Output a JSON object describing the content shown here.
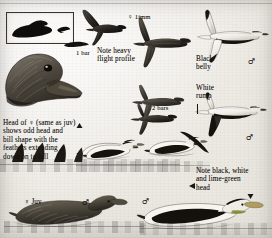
{
  "plate": {
    "title": "Common Eider identification plate",
    "width": 272,
    "height": 238,
    "paper_color": "#f2f0ec",
    "ink_color": "#181511"
  },
  "annotations": [
    {
      "id": "one-bar",
      "text": "1 bar",
      "x": 76,
      "y": 49
    },
    {
      "id": "note-heavy",
      "text": "Note heavy\nflight profile",
      "x": 97,
      "y": 48
    },
    {
      "id": "female-1imm",
      "text": "♀ 1imm",
      "x": 128,
      "y": 14
    },
    {
      "id": "black-belly",
      "text": "Black\nbelly",
      "x": 196,
      "y": 56
    },
    {
      "id": "white-rump",
      "text": "White\nrump",
      "x": 196,
      "y": 85
    },
    {
      "id": "two-bars",
      "text": "2 bars",
      "x": 152,
      "y": 105
    },
    {
      "id": "head-of-female",
      "text": "Head of ♀ (same as juv)\nshows odd head and\nbill shape with the\nfeathers extending\ndown on to bill",
      "x": 3,
      "y": 120
    },
    {
      "id": "female-juv",
      "text": "♀ Juv",
      "x": 24,
      "y": 199
    },
    {
      "id": "note-black-white",
      "text": "Note black, white\nand lime-green\nhead",
      "x": 196,
      "y": 168
    }
  ],
  "sex_symbols": [
    {
      "id": "male-top-right",
      "symbol": "♂",
      "x": 248,
      "y": 60
    },
    {
      "id": "male-mid-right",
      "symbol": "♂",
      "x": 246,
      "y": 136
    },
    {
      "id": "male-bottom-left",
      "symbol": "♂",
      "x": 82,
      "y": 200
    },
    {
      "id": "male-bottom-mid",
      "symbol": "♂",
      "x": 142,
      "y": 199
    }
  ],
  "figures": [
    {
      "id": "silhouette-box",
      "label": "framed swimming eider silhouette",
      "x": 6,
      "y": 12,
      "w": 66,
      "h": 30
    },
    {
      "id": "head-portrait",
      "label": "female eider head portrait",
      "x": 2,
      "y": 44,
      "w": 78,
      "h": 72
    },
    {
      "id": "flight-dark-upper",
      "label": "dark eider in flight, upper left",
      "x": 78,
      "y": 10,
      "w": 48,
      "h": 34
    },
    {
      "id": "flight-female-imm",
      "label": "female immature in flight",
      "x": 128,
      "y": 10,
      "w": 60,
      "h": 52
    },
    {
      "id": "flight-male-upper",
      "label": "adult male in flight, black belly and white rump",
      "x": 190,
      "y": 12,
      "w": 76,
      "h": 56
    },
    {
      "id": "flight-pair-mid",
      "label": "two eiders in flight, mid plate",
      "x": 126,
      "y": 86,
      "w": 62,
      "h": 46
    },
    {
      "id": "flight-male-mid",
      "label": "adult male in flight, mid right",
      "x": 192,
      "y": 96,
      "w": 74,
      "h": 48
    },
    {
      "id": "swim-male-a",
      "label": "adult male swimming, centre",
      "x": 78,
      "y": 132,
      "w": 64,
      "h": 36
    },
    {
      "id": "swim-male-b",
      "label": "adult male swimming, right",
      "x": 146,
      "y": 130,
      "w": 62,
      "h": 36
    },
    {
      "id": "swim-female-juv",
      "label": "female juvenile swimming",
      "x": 12,
      "y": 190,
      "w": 112,
      "h": 44
    },
    {
      "id": "swim-male-large",
      "label": "adult male swimming, foreground",
      "x": 140,
      "y": 192,
      "w": 126,
      "h": 44
    }
  ],
  "water_bands": [
    {
      "id": "water-upper",
      "x": 0,
      "y": 160,
      "w": 176,
      "h": 14
    },
    {
      "id": "water-mid",
      "x": 78,
      "y": 162,
      "w": 130,
      "h": 10
    },
    {
      "id": "water-lower",
      "x": 6,
      "y": 222,
      "w": 136,
      "h": 12
    },
    {
      "id": "water-right",
      "x": 142,
      "y": 224,
      "w": 128,
      "h": 12
    }
  ],
  "icons": {
    "female_symbol": "♀",
    "male_symbol": "♂",
    "pointer_triangle": "▼",
    "pointer_left": "◀"
  }
}
